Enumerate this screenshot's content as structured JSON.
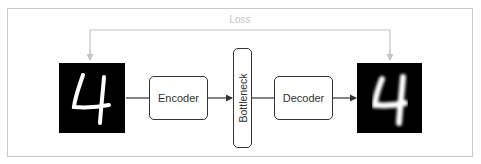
{
  "diagram": {
    "loss_label": "Loss",
    "input_image": {
      "digit": "4",
      "style": "sharp"
    },
    "encoder_label": "Encoder",
    "bottleneck_label": "Bottleneck",
    "decoder_label": "Decoder",
    "output_image": {
      "digit": "4",
      "style": "blurred"
    },
    "colors": {
      "frame": "#c8c8c8",
      "loss_line": "#c4c4c4",
      "box_border": "#333333",
      "arrow": "#333333",
      "image_bg": "#000000",
      "digit": "#ffffff"
    },
    "edges": [
      {
        "from": "input_image",
        "to": "encoder"
      },
      {
        "from": "encoder",
        "to": "bottleneck"
      },
      {
        "from": "bottleneck",
        "to": "decoder"
      },
      {
        "from": "decoder",
        "to": "output_image"
      },
      {
        "from": "loss",
        "to": "input_image"
      },
      {
        "from": "loss",
        "to": "output_image"
      }
    ]
  }
}
